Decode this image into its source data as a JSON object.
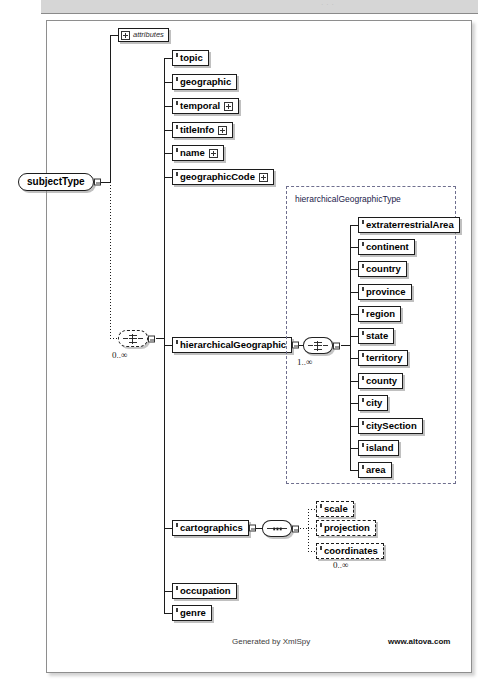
{
  "header": {
    "strip_text": "· ·  ·"
  },
  "diagram": {
    "root": {
      "label": "subjectType",
      "kind": "complexType-capsule"
    },
    "attributes_node": {
      "label": "attributes",
      "icon": "plus-expand-icon"
    },
    "root_choice": {
      "cardinality": "0..∞",
      "kind": "choice-compositor"
    },
    "children": [
      {
        "label": "topic",
        "expandable": false,
        "optional": false
      },
      {
        "label": "geographic",
        "expandable": false,
        "optional": false
      },
      {
        "label": "temporal",
        "expandable": true,
        "optional": false
      },
      {
        "label": "titleInfo",
        "expandable": true,
        "optional": false
      },
      {
        "label": "name",
        "expandable": true,
        "optional": false
      },
      {
        "label": "geographicCode",
        "expandable": true,
        "optional": false
      },
      {
        "label": "hierarchicalGeographic",
        "expandable": true,
        "optional": false
      },
      {
        "label": "cartographics",
        "expandable": true,
        "optional": false
      },
      {
        "label": "occupation",
        "expandable": false,
        "optional": false
      },
      {
        "label": "genre",
        "expandable": false,
        "optional": false
      }
    ],
    "hierarchical_type": {
      "label": "hierarchicalGeographicType",
      "choice_cardinality": "1..∞",
      "members": [
        {
          "label": "extraterrestrialArea"
        },
        {
          "label": "continent"
        },
        {
          "label": "country"
        },
        {
          "label": "province"
        },
        {
          "label": "region"
        },
        {
          "label": "state"
        },
        {
          "label": "territory"
        },
        {
          "label": "county"
        },
        {
          "label": "city"
        },
        {
          "label": "citySection"
        },
        {
          "label": "island"
        },
        {
          "label": "area"
        }
      ]
    },
    "cartographics_group": {
      "sequence_kind": "sequence-compositor",
      "cardinality": "0..∞",
      "members": [
        {
          "label": "scale"
        },
        {
          "label": "projection"
        },
        {
          "label": "coordinates"
        }
      ]
    }
  },
  "footer": {
    "generated_by": "Generated by XmlSpy",
    "website": "www.altova.com"
  },
  "colors": {
    "line": "#1c1c1c",
    "type_container": "#6f6f8e",
    "strip": "#d6d6d6"
  }
}
